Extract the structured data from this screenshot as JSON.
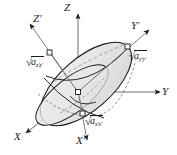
{
  "figure": {
    "caption_present": false,
    "background_color": "#ffffff",
    "ink_color": "#1a1a1a",
    "ellipsoid": {
      "surface_fill": "#e3e3e3",
      "surface_fill_light": "#efefef",
      "outline_color": "#1a1a1a",
      "hidden_line_color": "#9a9a9a",
      "tilt_degrees": 40
    },
    "axes": [
      {
        "name": "Z",
        "label": "Z",
        "prime": false,
        "kind": "lab",
        "direction": "up"
      },
      {
        "name": "Y",
        "label": "Y",
        "prime": false,
        "kind": "lab",
        "direction": "right"
      },
      {
        "name": "X",
        "label": "X",
        "prime": false,
        "kind": "lab",
        "direction": "down-left"
      },
      {
        "name": "Zp",
        "label": "Z",
        "prime": true,
        "kind": "principal",
        "direction": "up-left"
      },
      {
        "name": "Yp",
        "label": "Y",
        "prime": true,
        "kind": "principal",
        "direction": "up-right"
      },
      {
        "name": "Xp",
        "label": "X",
        "prime": true,
        "kind": "principal",
        "direction": "down"
      }
    ],
    "semi_axis_labels": [
      {
        "name": "zz",
        "radical": "√",
        "base": "a",
        "subscript": "z′z′",
        "position": "left"
      },
      {
        "name": "yy",
        "radical": "√",
        "base": "a",
        "subscript": "y′y′",
        "position": "right"
      },
      {
        "name": "xx",
        "radical": "√",
        "base": "a",
        "subscript": "x′x′",
        "position": "bottom"
      }
    ],
    "markers": {
      "vertex_marker_shape": "square",
      "vertex_marker_fill": "#ffffff",
      "count": 4
    }
  }
}
